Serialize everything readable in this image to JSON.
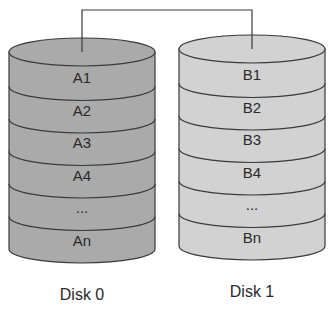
{
  "diagram": {
    "type": "RAID 1 mirroring",
    "colors": {
      "disk0_fill": "#aaaaaa",
      "disk1_fill": "#d2d2d2",
      "outline": "#3a3a3a",
      "text": "#2a2a2a"
    },
    "disks": [
      {
        "label": "Disk 0",
        "segments": [
          "A1",
          "A2",
          "A3",
          "A4",
          "...",
          "An"
        ]
      },
      {
        "label": "Disk 1",
        "segments": [
          "B1",
          "B2",
          "B3",
          "B4",
          "...",
          "Bn"
        ]
      }
    ]
  }
}
